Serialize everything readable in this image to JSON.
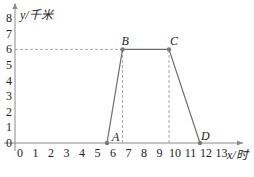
{
  "chart_data": {
    "type": "line",
    "title": "",
    "xlabel": "x/时",
    "ylabel": "y/千米",
    "x_ticks": [
      "0",
      "1",
      "2",
      "3",
      "4",
      "5",
      "6",
      "7",
      "8",
      "9",
      "10",
      "11",
      "12",
      "13"
    ],
    "y_ticks": [
      "0",
      "1",
      "2",
      "3",
      "4",
      "5",
      "6",
      "7",
      "8"
    ],
    "xlim": [
      0,
      13.8
    ],
    "ylim": [
      0,
      8.5
    ],
    "grid": false,
    "series": [
      {
        "name": "distance",
        "points": [
          {
            "label": "A",
            "x": 6,
            "y": 0
          },
          {
            "label": "B",
            "x": 7,
            "y": 6
          },
          {
            "label": "C",
            "x": 10,
            "y": 6
          },
          {
            "label": "D",
            "x": 12,
            "y": 0
          }
        ]
      }
    ],
    "guides": [
      {
        "type": "horizontal-dashed",
        "y": 6,
        "x_from": 0,
        "x_to": 7
      },
      {
        "type": "vertical-dashed",
        "x": 7,
        "y_from": 0,
        "y_to": 6
      },
      {
        "type": "vertical-dashed",
        "x": 10,
        "y_from": 0,
        "y_to": 6
      }
    ]
  },
  "colors": {
    "axis": "#8a8a8a",
    "line": "#6e6e6e",
    "dash": "#a8a8a8",
    "point": "#7a7a7a",
    "text": "#222222"
  }
}
